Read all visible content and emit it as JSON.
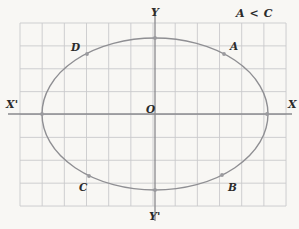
{
  "figure": {
    "width": 299,
    "height": 229,
    "background_color": "#f8f7f4"
  },
  "colors": {
    "paper": "#f8f7f4",
    "grid_line": "#c9c9cc",
    "axis_line": "#8a8a8e",
    "curve": "#8f8f93",
    "point_marker": "#9a9a9e",
    "text": "#2b2b2b"
  },
  "grid": {
    "visible": true,
    "left": 20,
    "top": 23,
    "right": 286,
    "bottom": 206,
    "columns": 12,
    "rows": 8,
    "cell_width": 22.17,
    "cell_height": 22.88
  },
  "axes": {
    "origin": {
      "x": 155,
      "y": 114
    },
    "x_axis": {
      "y": 114,
      "x_start": 8,
      "x_end": 292
    },
    "y_axis": {
      "x": 155,
      "y_start": 8,
      "y_end": 221
    },
    "labels": {
      "x_positive": "X",
      "x_negative": "X'",
      "y_positive": "Y",
      "y_negative": "Y'",
      "origin": "O"
    }
  },
  "annotation": {
    "text": "A < C"
  },
  "chart_data": {
    "type": "scatter",
    "title": "",
    "xlabel": "X",
    "ylabel": "Y",
    "grid": true,
    "legend": "none",
    "curve": {
      "name": "ellipse",
      "shape": "ellipse",
      "center": [
        155,
        114
      ],
      "semi_major_x": 113,
      "semi_minor_y": 76,
      "stroke": "#8f8f93"
    },
    "points": [
      {
        "label": "A",
        "cx": 224,
        "cy": 54,
        "label_x": 230,
        "label_y": 41
      },
      {
        "label": "B",
        "cx": 222,
        "cy": 175,
        "label_x": 228,
        "label_y": 182
      },
      {
        "label": "C",
        "cx": 89,
        "cy": 176,
        "label_x": 79,
        "label_y": 182
      },
      {
        "label": "D",
        "cx": 87,
        "cy": 54,
        "label_x": 71,
        "label_y": 42
      },
      {
        "label": "",
        "cx": 155,
        "cy": 38,
        "label_x": 0,
        "label_y": 0
      },
      {
        "label": "",
        "cx": 155,
        "cy": 190,
        "label_x": 0,
        "label_y": 0
      },
      {
        "label": "",
        "cx": 42,
        "cy": 114,
        "label_x": 0,
        "label_y": 0
      },
      {
        "label": "",
        "cx": 267,
        "cy": 114,
        "label_x": 0,
        "label_y": 0
      }
    ]
  },
  "label_positions": {
    "y_top": {
      "x": 151,
      "y": 7
    },
    "y_bottom": {
      "x": 149,
      "y": 211
    },
    "x_right": {
      "x": 288,
      "y": 99
    },
    "x_left": {
      "x": 6,
      "y": 99
    },
    "origin": {
      "x": 146,
      "y": 104
    },
    "note": {
      "x": 236,
      "y": 8
    }
  }
}
